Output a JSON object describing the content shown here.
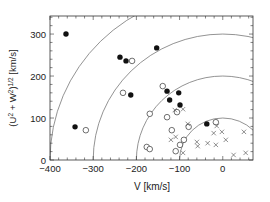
{
  "chart_data": {
    "type": "scatter",
    "title": "",
    "xlabel": "V [km/s]",
    "ylabel": "(U² + W²)¹ᐟ² [km/s]",
    "ylabel_parts": {
      "base": "(U",
      "s1": "2",
      "mid": " + W",
      "s2": "2",
      "close": ")",
      "s3": "1/2",
      "unit": " [km/s]"
    },
    "xlim": [
      -400,
      70
    ],
    "ylim": [
      0,
      343
    ],
    "xticks": [
      -400,
      -300,
      -200,
      -100,
      0
    ],
    "xtick_labels": [
      "−400",
      "−300",
      "−200",
      "−100",
      "0"
    ],
    "yticks": [
      0,
      100,
      200,
      300
    ],
    "ytick_labels": [
      "0",
      "100",
      "200",
      "300"
    ],
    "grid": false,
    "legend": null,
    "reference_curves": {
      "description": "Toomre-diagram circles of constant total peculiar velocity centered at V=0",
      "radii": [
        100,
        200,
        300,
        400
      ]
    },
    "series": [
      {
        "name": "filled circles",
        "marker": "filled-circle",
        "points": [
          [
            -363,
            300
          ],
          [
            -342,
            79
          ],
          [
            -238,
            245
          ],
          [
            -224,
            236
          ],
          [
            -213,
            155
          ],
          [
            -153,
            267
          ],
          [
            -129,
            164
          ],
          [
            -102,
            160
          ],
          [
            -123,
            143
          ],
          [
            -99,
            131
          ],
          [
            -37,
            86
          ]
        ]
      },
      {
        "name": "open circles",
        "marker": "open-circle",
        "points": [
          [
            -210,
            236
          ],
          [
            -231,
            160
          ],
          [
            -317,
            71
          ],
          [
            -139,
            176
          ],
          [
            -106,
            114
          ],
          [
            -129,
            102
          ],
          [
            -169,
            110
          ],
          [
            -176,
            31
          ],
          [
            -169,
            26
          ],
          [
            -118,
            71
          ],
          [
            -90,
            48
          ],
          [
            -109,
            21
          ],
          [
            -99,
            36
          ],
          [
            -16,
            90
          ],
          [
            -79,
            79
          ]
        ]
      },
      {
        "name": "crosses",
        "marker": "x",
        "points": [
          [
            -111,
            119
          ],
          [
            -92,
            121
          ],
          [
            -81,
            86
          ],
          [
            -21,
            64
          ],
          [
            -2,
            67
          ],
          [
            -14,
            81
          ],
          [
            49,
            67
          ],
          [
            -120,
            48
          ],
          [
            -109,
            55
          ],
          [
            -58,
            33
          ],
          [
            -35,
            40
          ],
          [
            -16,
            36
          ],
          [
            25,
            12
          ],
          [
            53,
            17
          ],
          [
            -60,
            43
          ],
          [
            -92,
            17
          ],
          [
            7,
            48
          ]
        ]
      }
    ]
  },
  "style": {
    "axis_color": "#333333",
    "curve_color": "#777777",
    "marker_color": "#111111"
  }
}
